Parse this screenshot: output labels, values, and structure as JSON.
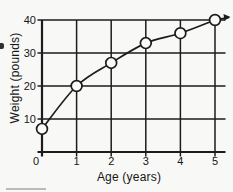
{
  "chart_data": {
    "type": "line",
    "title": "",
    "xlabel": "Age (years)",
    "ylabel": "Weight (pounds)",
    "x": [
      0,
      1,
      2,
      3,
      4,
      5
    ],
    "values": [
      7,
      20,
      27,
      33,
      36,
      40
    ],
    "xlim": [
      0,
      5
    ],
    "ylim": [
      0,
      40
    ],
    "x_ticks": [
      0,
      1,
      2,
      3,
      4,
      5
    ],
    "y_ticks": [
      0,
      10,
      20,
      30,
      40
    ],
    "grid": true,
    "legend_position": "none",
    "marker": "open-circle",
    "marker_fill": "#fafaf8",
    "line_color": "#1c1c1c",
    "text_color": "#161616",
    "background": "#f8f8f6",
    "arrow_at_end": true
  }
}
